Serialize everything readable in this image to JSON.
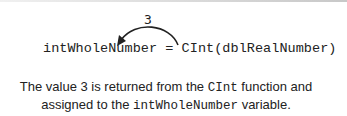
{
  "diagram": {
    "arrow": {
      "label": "3",
      "from": "CInt",
      "to": "intWholeNumber",
      "color": "#222222"
    },
    "code": {
      "target_var": "intWholeNumber",
      "operator": " = ",
      "function": "CInt",
      "open_paren": "(",
      "argument": "dblRealNumber",
      "close_paren": ")"
    },
    "caption": {
      "part1": "The value 3 is returned from the ",
      "func": "CInt",
      "part2": " function and",
      "part3": "assigned to the ",
      "var": "intWholeNumber",
      "part4": " variable."
    }
  }
}
